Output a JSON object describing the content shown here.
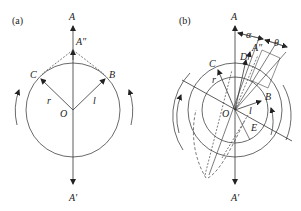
{
  "panel_a": {
    "tag": "(a)",
    "labels": {
      "A": "A",
      "A_double_prime": "A″",
      "A_prime": "A′",
      "B": "B",
      "C": "C",
      "O": "O",
      "r": "r",
      "l": "l"
    }
  },
  "panel_b": {
    "tag": "(b)",
    "labels": {
      "A": "A",
      "A_double_prime": "A″",
      "A_prime": "A′",
      "B": "B",
      "C": "C",
      "D": "D",
      "E": "E",
      "O": "O",
      "r": "r",
      "l": "l",
      "alpha": "α",
      "theta": "θ"
    }
  },
  "colors": {
    "stroke": "#333333",
    "text": "#222222",
    "background": "#ffffff"
  }
}
